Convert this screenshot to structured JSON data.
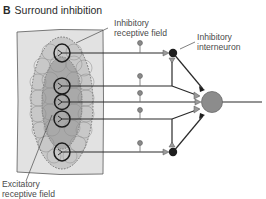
{
  "figure": {
    "panel_letter": "B",
    "title": "Surround inhibition"
  },
  "labels": {
    "inhibitory_rf_line1": "Inhibitory",
    "inhibitory_rf_line2": "receptive field",
    "interneuron_line1": "Inhibitory",
    "interneuron_line2": "interneuron",
    "excitatory_rf_line1": "Excitatory",
    "excitatory_rf_line2": "receptive field"
  },
  "colors": {
    "skin_sheet": "#e2e2e2",
    "inhibitory_field": "#c6c6c6",
    "excitatory_field": "#a8a8a8",
    "receptor_outline": "#1c1c1c",
    "inhibitory_interneuron": "#1e1e1e",
    "output_neuron": "#8c8c8c",
    "axon": "#2a2a2a",
    "collateral_knob": "#8a8a8a"
  },
  "structure": {
    "afferent_fibers": 5,
    "inhibitory_interneurons": 2,
    "output_neurons": 1
  }
}
